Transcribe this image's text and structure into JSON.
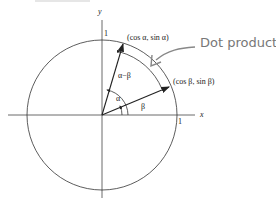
{
  "diagram": {
    "type": "unit-circle-angle-difference",
    "axes": {
      "x_label": "x",
      "y_label": "y"
    },
    "tick_labels": {
      "x_one": "1",
      "y_one": "1"
    },
    "points": {
      "A": {
        "label": "(cos α, sin α)"
      },
      "B": {
        "label": "(cos β, sin β)"
      }
    },
    "angles": {
      "alpha": "α",
      "beta": "β",
      "difference": "α−β"
    },
    "annotation": {
      "text": "Dot product"
    },
    "colors": {
      "lines": "#333333",
      "annotation": "#7a7a7a"
    }
  }
}
